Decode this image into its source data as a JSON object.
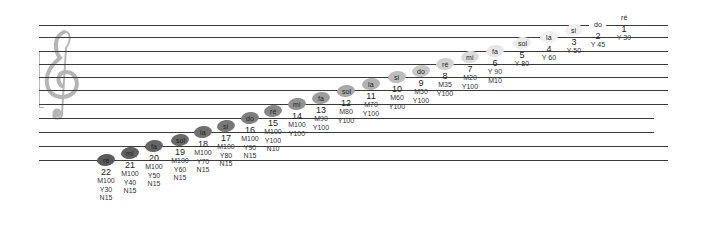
{
  "diagram": {
    "type": "musical-staff-color-scale",
    "clef": "treble-clef",
    "staff_lines": [
      {
        "y": 25,
        "x1": 39,
        "x2": 668
      },
      {
        "y": 37,
        "x1": 39,
        "x2": 668
      },
      {
        "y": 51,
        "x1": 39,
        "x2": 668
      },
      {
        "y": 64,
        "x1": 39,
        "x2": 668
      },
      {
        "y": 77,
        "x1": 39,
        "x2": 668
      },
      {
        "y": 90,
        "x1": 39,
        "x2": 668
      },
      {
        "y": 104,
        "x1": 39,
        "x2": 668
      },
      {
        "y": 118,
        "x1": 39,
        "x2": 654
      },
      {
        "y": 132,
        "x1": 39,
        "x2": 654
      },
      {
        "y": 146,
        "x1": 39,
        "x2": 668
      },
      {
        "y": 160,
        "x1": 39,
        "x2": 668
      }
    ],
    "notes": [
      {
        "num": "1",
        "name": "ré",
        "codes": [
          "Y 30"
        ],
        "x": 624,
        "y": 17,
        "shade": "#ffffff"
      },
      {
        "num": "2",
        "name": "do",
        "codes": [
          "Y 45"
        ],
        "x": 598,
        "y": 24,
        "shade": "#ffffff"
      },
      {
        "num": "3",
        "name": "si",
        "codes": [
          "Y 50"
        ],
        "x": 574,
        "y": 30,
        "shade": "#f0f0f0"
      },
      {
        "num": "4",
        "name": "la",
        "codes": [
          "Y 60"
        ],
        "x": 549,
        "y": 37,
        "shade": "#f0f0f0"
      },
      {
        "num": "5",
        "name": "sol",
        "codes": [
          "Y 80"
        ],
        "x": 522,
        "y": 43,
        "shade": "#ececec"
      },
      {
        "num": "6",
        "name": "fa",
        "codes": [
          "Y 90",
          "M10"
        ],
        "x": 495,
        "y": 51,
        "shade": "#e6e6e6"
      },
      {
        "num": "7",
        "name": "mi",
        "codes": [
          "M20",
          "Y100"
        ],
        "x": 470,
        "y": 57,
        "shade": "#dcdcdc"
      },
      {
        "num": "8",
        "name": "ré",
        "codes": [
          "M35",
          "Y100"
        ],
        "x": 445,
        "y": 64,
        "shade": "#d2d2d2"
      },
      {
        "num": "9",
        "name": "do",
        "codes": [
          "M50",
          "Y100"
        ],
        "x": 421,
        "y": 71,
        "shade": "#c8c8c8"
      },
      {
        "num": "10",
        "name": "si",
        "codes": [
          "M60",
          "Y100"
        ],
        "x": 397,
        "y": 77,
        "shade": "#bdbdbd"
      },
      {
        "num": "11",
        "name": "la",
        "codes": [
          "M70",
          "Y100"
        ],
        "x": 371,
        "y": 84,
        "shade": "#b2b2b2"
      },
      {
        "num": "12",
        "name": "sol",
        "codes": [
          "M80",
          "Y100"
        ],
        "x": 346,
        "y": 91,
        "shade": "#a8a8a8"
      },
      {
        "num": "13",
        "name": "fa",
        "codes": [
          "M90",
          "Y100"
        ],
        "x": 321,
        "y": 98,
        "shade": "#9d9d9d"
      },
      {
        "num": "14",
        "name": "mi",
        "codes": [
          "M100",
          "Y100"
        ],
        "x": 297,
        "y": 104,
        "shade": "#929292"
      },
      {
        "num": "15",
        "name": "ré",
        "codes": [
          "M100",
          "Y100",
          "N10"
        ],
        "x": 273,
        "y": 111,
        "shade": "#878787"
      },
      {
        "num": "16",
        "name": "do",
        "codes": [
          "M100",
          "Y90",
          "N15"
        ],
        "x": 250,
        "y": 118,
        "shade": "#7e7e7e"
      },
      {
        "num": "17",
        "name": "si",
        "codes": [
          "M100",
          "Y80",
          "N15"
        ],
        "x": 226,
        "y": 126,
        "shade": "#777777"
      },
      {
        "num": "18",
        "name": "la",
        "codes": [
          "M100",
          "Y70",
          "N15"
        ],
        "x": 203,
        "y": 132,
        "shade": "#707070"
      },
      {
        "num": "19",
        "name": "sol",
        "codes": [
          "M100",
          "Y60",
          "N15"
        ],
        "x": 180,
        "y": 140,
        "shade": "#6a6a6a"
      },
      {
        "num": "20",
        "name": "fa",
        "codes": [
          "M100",
          "Y50",
          "N15"
        ],
        "x": 154,
        "y": 146,
        "shade": "#656565"
      },
      {
        "num": "21",
        "name": "mi",
        "codes": [
          "M100",
          "Y40",
          "N15"
        ],
        "x": 130,
        "y": 153,
        "shade": "#606060"
      },
      {
        "num": "22",
        "name": "ré",
        "codes": [
          "M100",
          "Y30",
          "N15"
        ],
        "x": 106,
        "y": 160,
        "shade": "#5a5a5a"
      }
    ]
  }
}
